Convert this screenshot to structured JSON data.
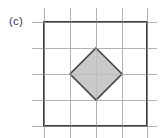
{
  "figure": {
    "panel_label": "(c)",
    "caption_position": "left",
    "background_color": "#ffffff",
    "width": 166,
    "height": 138
  },
  "colors": {
    "grid_line": "#b3b3b3",
    "square_stroke": "#3d3d3d",
    "diamond_stroke": "#464646",
    "diamond_fill": "#c9c9c9",
    "label_text": "#3a3a3a",
    "background": "#ffffff"
  },
  "chart_data": {
    "type": "diagram",
    "title": "(c)",
    "grid": {
      "cell_size": 26,
      "vertical_line_x": [
        44,
        70,
        96,
        122,
        147
      ],
      "horizontal_line_y": [
        22,
        48,
        74,
        100,
        126
      ],
      "overhang_top": 14,
      "overhang_bottom": 12,
      "overhang_left": 12,
      "overhang_right": 10,
      "line_width": 1,
      "visible": true
    },
    "shapes": [
      {
        "name": "outer-square",
        "type": "rect",
        "x": 44,
        "y": 22,
        "width": 103,
        "height": 104,
        "side_in_cells": 4,
        "stroke": "#3d3d3d",
        "stroke_width": 2.4,
        "fill": "none"
      },
      {
        "name": "inscribed-diamond",
        "type": "polygon",
        "points": [
          [
            96,
            48
          ],
          [
            122,
            74
          ],
          [
            96,
            100
          ],
          [
            70,
            74
          ]
        ],
        "diagonal_in_cells": 2,
        "stroke": "#464646",
        "stroke_width": 1.6,
        "fill": "#c9c9c9"
      }
    ],
    "xlabel": "",
    "ylabel": "",
    "legend": [],
    "annotations": [
      "(c)"
    ]
  }
}
